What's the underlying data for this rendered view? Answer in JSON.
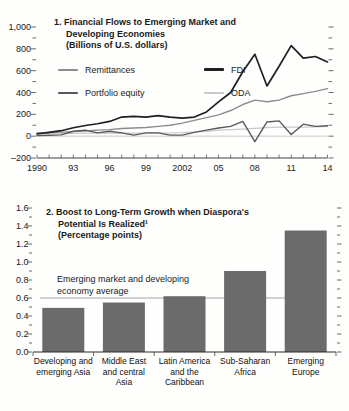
{
  "figure_background": "#fefefd",
  "chart_data": [
    {
      "type": "line",
      "title": "1. Financial Flows to Emerging Market and Developing Economies",
      "subtitle": "(Billions of U.S. dollars)",
      "title_lines": [
        "1. Financial Flows to Emerging Market and",
        "Developing Economies",
        "(Billions of U.S. dollars)"
      ],
      "x": [
        1990,
        1991,
        1992,
        1993,
        1994,
        1995,
        1996,
        1997,
        1998,
        1999,
        2000,
        2001,
        2002,
        2003,
        2004,
        2005,
        2006,
        2007,
        2008,
        2009,
        2010,
        2011,
        2012,
        2013,
        2014
      ],
      "xticks": [
        {
          "year": 1990,
          "label": "1990"
        },
        {
          "year": 1993,
          "label": "93"
        },
        {
          "year": 1996,
          "label": "96"
        },
        {
          "year": 1999,
          "label": "99"
        },
        {
          "year": 2002,
          "label": "2002"
        },
        {
          "year": 2005,
          "label": "05"
        },
        {
          "year": 2008,
          "label": "08"
        },
        {
          "year": 2011,
          "label": "11"
        },
        {
          "year": 2014,
          "label": "14"
        }
      ],
      "ylim": [
        -200,
        1000
      ],
      "ytick_values": [
        -200,
        0,
        200,
        400,
        600,
        800,
        1000
      ],
      "ytick_labels": [
        "–200",
        "0",
        "200",
        "400",
        "600",
        "800",
        "1,000"
      ],
      "minor_tick_step": 100,
      "zero_line": 0,
      "zero_line_color": "#c9c9c9",
      "legend_columns": [
        [
          "Remittances",
          "Portfolio equity"
        ],
        [
          "FDI",
          "ODA"
        ]
      ],
      "series": [
        {
          "name": "Remittances",
          "color": "#8c8c8c",
          "stroke_width": 1.4,
          "values": [
            30,
            33,
            37,
            42,
            48,
            55,
            60,
            70,
            75,
            80,
            90,
            100,
            120,
            145,
            170,
            195,
            235,
            290,
            330,
            315,
            330,
            370,
            390,
            410,
            435
          ]
        },
        {
          "name": "Portfolio equity",
          "color": "#595959",
          "stroke_width": 1.4,
          "values": [
            5,
            8,
            12,
            45,
            55,
            30,
            45,
            30,
            10,
            30,
            30,
            10,
            10,
            35,
            55,
            75,
            90,
            135,
            -50,
            130,
            140,
            15,
            110,
            90,
            95
          ]
        },
        {
          "name": "FDI",
          "color": "#1f1f1f",
          "stroke_width": 1.7,
          "values": [
            20,
            35,
            50,
            77,
            98,
            114,
            135,
            175,
            182,
            175,
            188,
            175,
            166,
            175,
            222,
            314,
            400,
            590,
            750,
            460,
            640,
            830,
            715,
            730,
            680
          ]
        },
        {
          "name": "ODA",
          "color": "#c9c9c9",
          "stroke_width": 1.2,
          "values": [
            25,
            27,
            26,
            26,
            27,
            28,
            27,
            26,
            27,
            28,
            28,
            29,
            32,
            38,
            44,
            55,
            60,
            65,
            72,
            78,
            82,
            84,
            83,
            86,
            90
          ]
        }
      ]
    },
    {
      "type": "bar",
      "title": "2. Boost to Long-Term Growth when Diaspora's Potential Is Realized",
      "title_superscript": "1",
      "subtitle": "(Percentage points)",
      "title_lines": [
        "2. Boost to Long-Term Growth when Diaspora's",
        "Potential Is Realized¹",
        "(Percentage points)"
      ],
      "categories": [
        "Developing and emerging Asia",
        "Middle East and central Asia",
        "Latin America and the Caribbean",
        "Sub-Saharan Africa",
        "Emerging Europe"
      ],
      "category_lines": [
        [
          "Developing and",
          "emerging Asia"
        ],
        [
          "Middle East",
          "and central",
          "Asia"
        ],
        [
          "Latin America",
          "and the",
          "Caribbean"
        ],
        [
          "Sub-Saharan",
          "Africa"
        ],
        [
          "Emerging",
          "Europe"
        ]
      ],
      "values": [
        0.49,
        0.55,
        0.62,
        0.9,
        1.35
      ],
      "ylim": [
        0,
        1.6
      ],
      "ytick_values": [
        0,
        0.2,
        0.4,
        0.6,
        0.8,
        1.0,
        1.2,
        1.4,
        1.6
      ],
      "ytick_labels": [
        "0.0",
        "0.2",
        "0.4",
        "0.6",
        "0.8",
        "1.0",
        "1.2",
        "1.4",
        "1.6"
      ],
      "minor_tick_step": 0.1,
      "bar_color": "#6b6b6b",
      "annotation": {
        "lines": [
          "Emerging market and developing",
          "economy average"
        ],
        "line_value": 0.6,
        "line_color": "#9a9a9a"
      }
    }
  ]
}
